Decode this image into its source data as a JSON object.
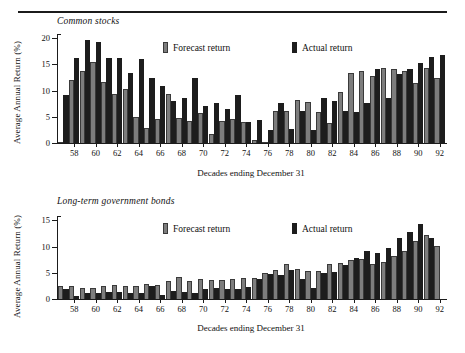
{
  "document": {
    "rule_present": true
  },
  "legend": {
    "forecast_label": "Forecast return",
    "actual_label": "Actual return",
    "forecast_color": "#7d7d7d",
    "actual_color": "#1d1d1d"
  },
  "axes": {
    "xlabel": "Decades ending December 31",
    "ylabel": "Average Annual Return (%)"
  },
  "chart_data": [
    {
      "type": "bar",
      "title": "Common stocks",
      "xlabel": "Decades ending December 31",
      "ylabel": "Average Annual Return (%)",
      "ylim": [
        0,
        21
      ],
      "yticks": [
        0,
        5,
        10,
        15,
        20
      ],
      "ytick_labels": [
        "0",
        "5",
        "10",
        "15",
        "20"
      ],
      "grid": false,
      "legend_position": "top-center",
      "categories": [
        "57",
        "58",
        "59",
        "60",
        "61",
        "62",
        "63",
        "64",
        "65",
        "66",
        "67",
        "68",
        "69",
        "70",
        "71",
        "72",
        "73",
        "74",
        "75",
        "76",
        "77",
        "78",
        "79",
        "80",
        "81",
        "82",
        "83",
        "84",
        "85",
        "86",
        "87",
        "88",
        "89",
        "90",
        "91",
        "92"
      ],
      "tick_labels": [
        "",
        "58",
        "",
        "60",
        "",
        "62",
        "",
        "64",
        "",
        "66",
        "",
        "68",
        "",
        "70",
        "",
        "72",
        "",
        "74",
        "",
        "76",
        "",
        "78",
        "",
        "80",
        "",
        "82",
        "",
        "84",
        "",
        "86",
        "",
        "88",
        "",
        "90",
        "",
        "92"
      ],
      "series": [
        {
          "name": "Forecast return",
          "color": "#7d7d7d",
          "values": [
            0.0,
            12.2,
            13.9,
            15.6,
            11.8,
            9.4,
            10.4,
            5.1,
            2.8,
            4.6,
            9.4,
            4.8,
            4.3,
            5.8,
            1.7,
            4.2,
            4.7,
            4.0,
            0.5,
            0.0,
            6.1,
            6.2,
            8.3,
            7.9,
            6.0,
            3.9,
            9.9,
            13.4,
            13.9,
            13.0,
            14.4,
            14.2,
            13.9,
            11.5,
            14.5,
            12.5
          ]
        },
        {
          "name": "Actual return",
          "color": "#1d1d1d",
          "values": [
            9.2,
            16.4,
            19.9,
            19.4,
            16.3,
            16.4,
            13.5,
            16.1,
            12.5,
            10.9,
            8.1,
            8.7,
            12.5,
            7.2,
            7.7,
            6.5,
            9.3,
            4.1,
            4.4,
            2.6,
            7.8,
            2.7,
            6.2,
            2.6,
            8.6,
            8.0,
            6.1,
            5.9,
            7.7,
            14.2,
            8.6,
            13.3,
            14.3,
            15.4,
            16.6,
            17.0,
            14.9
          ]
        }
      ]
    },
    {
      "type": "bar",
      "title": "Long-term government bonds",
      "xlabel": "Decades ending December 31",
      "ylabel": "Average Annual Return (%)",
      "ylim": [
        0,
        16
      ],
      "yticks": [
        0,
        5,
        10,
        15
      ],
      "ytick_labels": [
        "0",
        "5",
        "10",
        "15"
      ],
      "grid": false,
      "legend_position": "top-center",
      "categories": [
        "57",
        "58",
        "59",
        "60",
        "61",
        "62",
        "63",
        "64",
        "65",
        "66",
        "67",
        "68",
        "69",
        "70",
        "71",
        "72",
        "73",
        "74",
        "75",
        "76",
        "77",
        "78",
        "79",
        "80",
        "81",
        "82",
        "83",
        "84",
        "85",
        "86",
        "87",
        "88",
        "89",
        "90",
        "91",
        "92"
      ],
      "tick_labels": [
        "",
        "58",
        "",
        "60",
        "",
        "62",
        "",
        "64",
        "",
        "66",
        "",
        "68",
        "",
        "70",
        "",
        "72",
        "",
        "74",
        "",
        "76",
        "",
        "78",
        "",
        "80",
        "",
        "82",
        "",
        "84",
        "",
        "86",
        "",
        "88",
        "",
        "90",
        "",
        "92"
      ],
      "series": [
        {
          "name": "Forecast return",
          "color": "#7d7d7d",
          "values": [
            2.5,
            2.6,
            2.1,
            2.1,
            2.6,
            2.7,
            2.5,
            2.6,
            2.9,
            2.7,
            3.5,
            4.2,
            3.5,
            3.8,
            3.6,
            3.7,
            3.8,
            4.0,
            4.1,
            5.0,
            5.5,
            6.7,
            5.8,
            5.4,
            5.4,
            6.7,
            6.9,
            7.5,
            7.7,
            6.8,
            7.2,
            8.2,
            9.3,
            11.2,
            12.4,
            10.3
          ]
        },
        {
          "name": "Actual return",
          "color": "#1d1d1d",
          "values": [
            1.9,
            0.6,
            1.2,
            1.2,
            1.3,
            1.3,
            1.2,
            1.1,
            2.6,
            0.8,
            1.6,
            1.4,
            1.1,
            2.0,
            2.1,
            1.9,
            1.9,
            2.4,
            3.9,
            4.8,
            4.6,
            5.5,
            3.8,
            2.2,
            5.1,
            5.3,
            6.5,
            7.9,
            9.2,
            8.8,
            9.9,
            11.7,
            12.9,
            14.4,
            11.8
          ]
        }
      ]
    }
  ]
}
